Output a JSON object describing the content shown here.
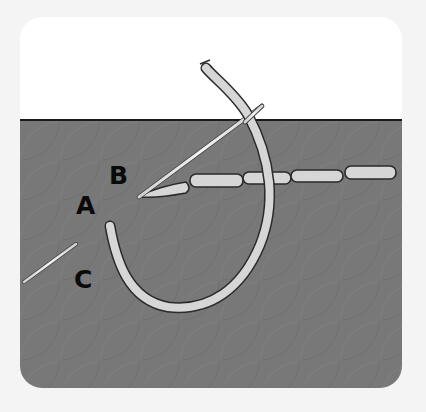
{
  "diagram": {
    "type": "embroidery-stitch-illustration",
    "labels": {
      "a": "A",
      "b": "B",
      "c": "C"
    },
    "colors": {
      "page_background": "#f4f4f4",
      "card_background": "#ffffff",
      "fabric": "#787878",
      "fabric_edge": "#1a1a1a",
      "thread_fill": "#d6d6d6",
      "thread_outline": "#2a2a2a",
      "needle": "#e6e6e6",
      "label": "#0a0a0a"
    },
    "elements": [
      {
        "name": "fabric",
        "description": "gray textured fabric filling lower portion of card"
      },
      {
        "name": "thread-loop",
        "description": "thread coming up at A, looping over to the top"
      },
      {
        "name": "needle-main",
        "description": "needle entering at B, exiting above fabric edge"
      },
      {
        "name": "needle-c",
        "description": "needle fragment near C"
      },
      {
        "name": "stitch-row",
        "description": "row of completed stitches extending right from B"
      }
    ],
    "stitch_count": 6
  }
}
